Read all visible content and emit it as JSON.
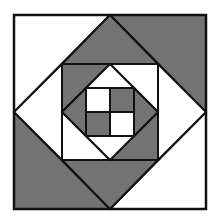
{
  "diagram": {
    "colors": {
      "light": "#ffffff",
      "dark": "#737373",
      "outline": "#111111"
    },
    "pieces": [
      {
        "name": "outer-corner-top-left",
        "shade": "light"
      },
      {
        "name": "outer-corner-top-right",
        "shade": "dark"
      },
      {
        "name": "outer-corner-bottom-right",
        "shade": "light"
      },
      {
        "name": "outer-corner-bottom-left",
        "shade": "dark"
      },
      {
        "name": "diamond-triangle-top",
        "shade": "dark"
      },
      {
        "name": "diamond-triangle-right",
        "shade": "light"
      },
      {
        "name": "diamond-triangle-bottom",
        "shade": "dark"
      },
      {
        "name": "diamond-triangle-left",
        "shade": "light"
      },
      {
        "name": "middle-corner-top-left",
        "shade": "dark"
      },
      {
        "name": "middle-corner-top-right",
        "shade": "light"
      },
      {
        "name": "middle-corner-bottom-right",
        "shade": "dark"
      },
      {
        "name": "middle-corner-bottom-left",
        "shade": "light"
      },
      {
        "name": "inner-triangle-top",
        "shade": "light"
      },
      {
        "name": "inner-triangle-right",
        "shade": "dark"
      },
      {
        "name": "inner-triangle-bottom",
        "shade": "light"
      },
      {
        "name": "inner-triangle-left",
        "shade": "dark"
      },
      {
        "name": "four-patch-top-left",
        "shade": "light"
      },
      {
        "name": "four-patch-top-right",
        "shade": "dark"
      },
      {
        "name": "four-patch-bottom-left",
        "shade": "dark"
      },
      {
        "name": "four-patch-bottom-right",
        "shade": "light"
      }
    ]
  }
}
